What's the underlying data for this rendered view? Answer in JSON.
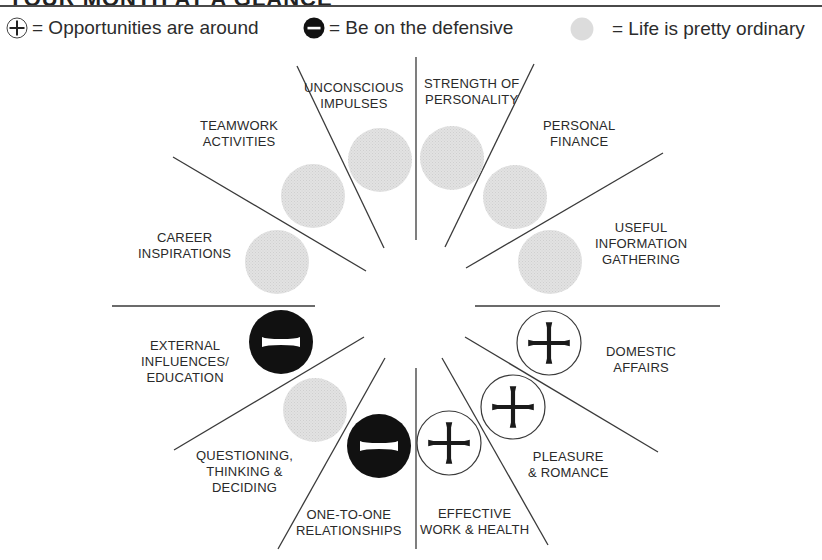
{
  "header": {
    "title": "YOUR MONTH AT A GLANCE"
  },
  "legend": [
    {
      "symbol": "plus-circle",
      "text": "= Opportunities are around"
    },
    {
      "symbol": "minus-circle",
      "text": "= Be on the defensive"
    },
    {
      "symbol": "gray-circle",
      "text": "= Life is pretty ordinary"
    }
  ],
  "colors": {
    "line": "#3a3a3a",
    "gray_dot": "#dcdcdc",
    "black_dot": "#111111",
    "text": "#2a2a2a"
  },
  "sectors": [
    {
      "id": "unconscious",
      "line1": "UNCONSCIOUS",
      "line2": "IMPULSES",
      "line3": "",
      "status": "ordinary"
    },
    {
      "id": "strength",
      "line1": "STRENGTH OF",
      "line2": "PERSONALITY",
      "line3": "",
      "status": "ordinary"
    },
    {
      "id": "finance",
      "line1": "PERSONAL",
      "line2": "FINANCE",
      "line3": "",
      "status": "ordinary"
    },
    {
      "id": "information",
      "line1": "USEFUL",
      "line2": "INFORMATION",
      "line3": "GATHERING",
      "status": "ordinary"
    },
    {
      "id": "domestic",
      "line1": "DOMESTIC",
      "line2": "AFFAIRS",
      "line3": "",
      "status": "opportunity"
    },
    {
      "id": "pleasure",
      "line1": "PLEASURE",
      "line2": "& ROMANCE",
      "line3": "",
      "status": "opportunity"
    },
    {
      "id": "work",
      "line1": "EFFECTIVE",
      "line2": "WORK & HEALTH",
      "line3": "",
      "status": "opportunity"
    },
    {
      "id": "relationships",
      "line1": "ONE-TO-ONE",
      "line2": "RELATIONSHIPS",
      "line3": "",
      "status": "defensive"
    },
    {
      "id": "questioning",
      "line1": "QUESTIONING,",
      "line2": "THINKING &",
      "line3": "DECIDING",
      "status": "ordinary"
    },
    {
      "id": "external",
      "line1": "EXTERNAL",
      "line2": "INFLUENCES/",
      "line3": "EDUCATION",
      "status": "defensive"
    },
    {
      "id": "career",
      "line1": "CAREER",
      "line2": "INSPIRATIONS",
      "line3": "",
      "status": "ordinary"
    },
    {
      "id": "teamwork",
      "line1": "TEAMWORK",
      "line2": "ACTIVITIES",
      "line3": "",
      "status": "ordinary"
    }
  ]
}
